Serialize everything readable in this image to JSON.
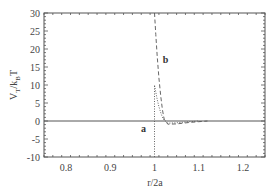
{
  "chart_data": {
    "type": "line",
    "title": "",
    "xlabel": "r/2a",
    "ylabel": "V_T/k_B T",
    "ylabel_parts": {
      "main": "V",
      "sub1": "T",
      "mid": "/k",
      "sub2": "B",
      "end": "T"
    },
    "xlim": [
      0.75,
      1.25
    ],
    "ylim": [
      -10,
      30
    ],
    "xticks": [
      0.8,
      0.9,
      1,
      1.1,
      1.2
    ],
    "xtick_labels": [
      "0.8",
      "0.9",
      "1",
      "1.1",
      "1.2"
    ],
    "yticks": [
      -10,
      -5,
      0,
      5,
      10,
      15,
      20,
      25,
      30
    ],
    "ytick_labels": [
      "-10",
      "-5",
      "0",
      "5",
      "10",
      "15",
      "20",
      "25",
      "30"
    ],
    "grid": false,
    "legend": null,
    "zero_line": true,
    "series": [
      {
        "name": "a",
        "style": "dotted",
        "x": [
          1.0,
          1.0,
          1.003,
          1.006,
          1.01,
          1.015,
          1.02,
          1.03,
          1.05,
          1.08,
          1.1
        ],
        "y": [
          -10,
          10,
          8,
          6,
          4,
          2,
          0.5,
          -0.6,
          -0.5,
          -0.2,
          0
        ]
      },
      {
        "name": "b",
        "style": "dashed",
        "x": [
          1.0,
          1.003,
          1.006,
          1.01,
          1.014,
          1.018,
          1.022,
          1.03,
          1.05,
          1.08,
          1.1,
          1.12
        ],
        "y": [
          30,
          24,
          18,
          12,
          7,
          3,
          0.5,
          -0.9,
          -0.8,
          -0.4,
          -0.2,
          0
        ]
      }
    ],
    "annotations": [
      {
        "text": "a",
        "x": 0.975,
        "y": -3
      },
      {
        "text": "b",
        "x": 1.025,
        "y": 16
      }
    ]
  }
}
